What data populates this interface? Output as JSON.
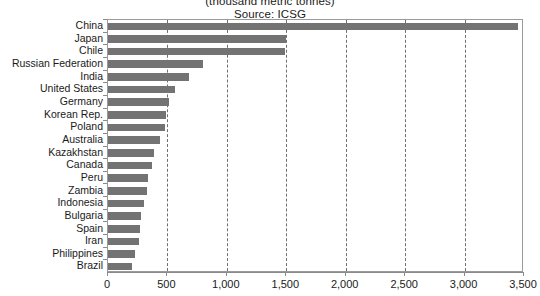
{
  "title": {
    "line1": "(thousand metric tonnes)",
    "line2": "Source: ICSG"
  },
  "axis": {
    "x_ticks": [
      "0",
      "500",
      "1,000",
      "1,500",
      "2,000",
      "2,500",
      "3,000",
      "3,500"
    ]
  },
  "colors": {
    "bar": "#737373",
    "gridline": "#6f6f6f",
    "axis": "#8a8a8a",
    "background": "#ffffff",
    "text": "#1a1a1a"
  },
  "chart_data": {
    "type": "bar",
    "orientation": "horizontal",
    "title": "(thousand metric tonnes)",
    "subtitle": "Source: ICSG",
    "xlabel": "",
    "ylabel": "",
    "xlim": [
      0,
      3500
    ],
    "xticks": [
      0,
      500,
      1000,
      1500,
      2000,
      2500,
      3000,
      3500
    ],
    "xtick_labels": [
      "0",
      "500",
      "1,000",
      "1,500",
      "2,000",
      "2,500",
      "3,000",
      "3,500"
    ],
    "grid": true,
    "grid_axis": "x",
    "grid_style": "dashed",
    "legend": false,
    "categories": [
      "China",
      "Japan",
      "Chile",
      "Russian Federation",
      "India",
      "United States",
      "Germany",
      "Korean Rep.",
      "Poland",
      "Australia",
      "Kazakhstan",
      "Canada",
      "Peru",
      "Zambia",
      "Indonesia",
      "Bulgaria",
      "Spain",
      "Iran",
      "Philippines",
      "Brazil"
    ],
    "values": [
      3450,
      1500,
      1490,
      800,
      680,
      560,
      510,
      490,
      480,
      440,
      390,
      370,
      340,
      330,
      300,
      280,
      270,
      260,
      230,
      200
    ]
  }
}
